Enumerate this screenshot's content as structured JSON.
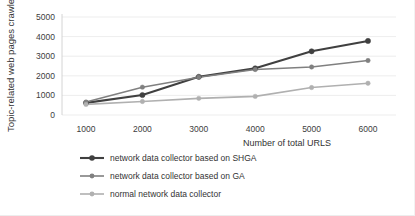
{
  "chart_data": {
    "type": "line",
    "title": "",
    "xlabel": "Number of total URLS",
    "ylabel": "Topic-related web pages crawled",
    "categories": [
      1000,
      2000,
      3000,
      4000,
      5000,
      6000
    ],
    "xtick_labels": [
      "1000",
      "2000",
      "3000",
      "4000",
      "5000",
      "6000"
    ],
    "ytick_labels": [
      "0",
      "1000",
      "2000",
      "3000",
      "4000",
      "5000"
    ],
    "yticks": [
      0,
      1000,
      2000,
      3000,
      4000,
      5000
    ],
    "ylim": [
      0,
      5000
    ],
    "grid": true,
    "legend_position": "bottom-left",
    "series": [
      {
        "name": "network data collector based on SHGA",
        "color": "#404040",
        "values": [
          620,
          1020,
          1950,
          2380,
          3250,
          3780
        ]
      },
      {
        "name": "network data collector based on GA",
        "color": "#808080",
        "values": [
          660,
          1420,
          1930,
          2320,
          2450,
          2780
        ]
      },
      {
        "name": "normal network data collector",
        "color": "#b0b0b0",
        "values": [
          540,
          690,
          850,
          950,
          1400,
          1620
        ]
      }
    ]
  },
  "legend": {
    "items": [
      "network data collector based on SHGA",
      "network data collector based on GA",
      "normal network data collector"
    ]
  },
  "axes": {
    "x_title": "Number of total URLS",
    "y_title": "Topic-related web pages crawled"
  }
}
